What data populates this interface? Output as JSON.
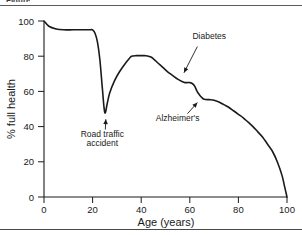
{
  "figure": {
    "caption_fragment": "Figure",
    "has_top_rule": true,
    "has_bottom_rule": true
  },
  "chart_data": {
    "type": "line",
    "title": "",
    "subtitle": "",
    "xlabel": "Age (years)",
    "ylabel": "% full health",
    "xlim": [
      0,
      100
    ],
    "ylim": [
      0,
      100
    ],
    "xticks": [
      0,
      20,
      40,
      60,
      80,
      100
    ],
    "yticks": [
      0,
      20,
      40,
      60,
      80,
      100
    ],
    "xtick_labels": [
      "0",
      "20",
      "40",
      "60",
      "80",
      "100"
    ],
    "ytick_labels": [
      "0",
      "20",
      "40",
      "60",
      "80",
      "100"
    ],
    "grid": false,
    "legend": false,
    "legend_position": "none",
    "line_color": "#1a1a1a",
    "line_width": 1.6,
    "series": [
      {
        "name": "% full health",
        "x": [
          0,
          2,
          5,
          8,
          12,
          16,
          19,
          20,
          21,
          22,
          23,
          24,
          25,
          26,
          27,
          29,
          31,
          33,
          35,
          36,
          38,
          40,
          42,
          44,
          45,
          47,
          49,
          51,
          53,
          55,
          57,
          58,
          59,
          60,
          61,
          62,
          63,
          64,
          65,
          66,
          68,
          70,
          72,
          74,
          76,
          78,
          80,
          82,
          84,
          86,
          88,
          90,
          92,
          94,
          96,
          98,
          99,
          100
        ],
        "y": [
          100,
          97,
          95.5,
          95,
          95,
          95,
          95,
          95,
          93,
          88,
          78,
          62,
          48,
          53,
          59,
          66,
          71,
          75,
          78.5,
          80,
          80.3,
          80.3,
          80.3,
          79.5,
          78.5,
          76,
          73.5,
          71,
          69,
          67,
          65.5,
          65,
          65,
          65,
          64.5,
          63,
          60,
          58,
          56.5,
          55.5,
          55.3,
          55,
          54,
          52.5,
          51,
          49,
          47,
          45,
          42.5,
          40,
          37,
          34,
          30,
          26,
          20,
          12,
          6,
          0
        ]
      }
    ],
    "annotations": [
      {
        "id": "road-traffic-accident",
        "text": "Road traffic\naccident",
        "line1": "Road traffic",
        "line2": "accident",
        "label_x": 24,
        "label_y": 34,
        "point_x": 25.5,
        "point_y": 46,
        "arrow_direction": "up-right"
      },
      {
        "id": "diabetes",
        "text": "Diabetes",
        "line1": "Diabetes",
        "line2": "",
        "label_x": 68,
        "label_y": 90,
        "point_x": 57,
        "point_y": 69,
        "arrow_direction": "down-left"
      },
      {
        "id": "alzheimers",
        "text": "Alzheimer's",
        "line1": "Alzheimer's",
        "line2": "",
        "label_x": 55,
        "label_y": 43,
        "point_x": 64,
        "point_y": 55,
        "arrow_direction": "up-right"
      }
    ]
  }
}
